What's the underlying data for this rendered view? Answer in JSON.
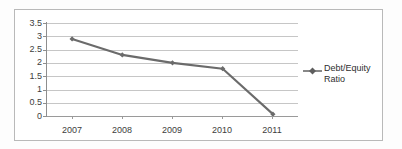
{
  "chart_data": {
    "type": "line",
    "title": "",
    "xlabel": "",
    "ylabel": "",
    "categories": [
      "2007",
      "2008",
      "2009",
      "2010",
      "2011"
    ],
    "series": [
      {
        "name": "Debt/Equity Ratio",
        "values": [
          2.9,
          2.3,
          2.0,
          1.78,
          0.07
        ],
        "color": "#6b6b6b",
        "marker": "diamond"
      }
    ],
    "ylim": [
      0,
      3.5
    ],
    "ytick_labels": [
      "3.5",
      "3",
      "2.5",
      "2",
      "1.5",
      "1",
      "0.5",
      "0"
    ],
    "ytick_values": [
      3.5,
      3,
      2.5,
      2,
      1.5,
      1,
      0.5,
      0
    ],
    "grid": true,
    "legend_position": "right"
  },
  "legend": {
    "entries": [
      {
        "label_line1": "Debt/Equity",
        "label_line2": "Ratio",
        "marker_name": "line-diamond-marker"
      }
    ]
  },
  "colors": {
    "series": "#6b6b6b",
    "gridline": "#c6c6c6",
    "axis": "#8e8e8e",
    "frame": "#b9b9b9",
    "text": "#3d3d3d",
    "background": "#ffffff"
  }
}
